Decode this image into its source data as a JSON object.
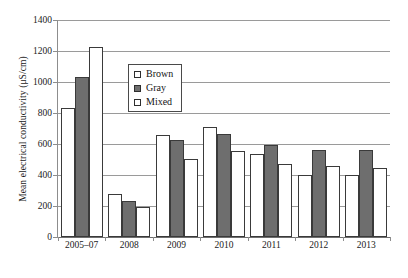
{
  "chart_data": {
    "type": "bar",
    "title": "",
    "xlabel": "",
    "ylabel": "Mean electrical conductivity (μS/cm)",
    "categories": [
      "2005–07",
      "2008",
      "2009",
      "2010",
      "2011",
      "2012",
      "2013"
    ],
    "series": [
      {
        "name": "Brown",
        "values": [
          830,
          275,
          655,
          710,
          535,
          400,
          400
        ]
      },
      {
        "name": "Gray",
        "values": [
          1030,
          230,
          625,
          665,
          595,
          560,
          560
        ]
      },
      {
        "name": "Mixed",
        "values": [
          1225,
          195,
          505,
          555,
          470,
          455,
          445
        ]
      }
    ],
    "ylim": [
      0,
      1400
    ],
    "yticks": [
      0,
      200,
      400,
      600,
      800,
      1000,
      1200,
      1400
    ],
    "ytick_labels": [
      "0",
      "200",
      "400",
      "600",
      "800",
      "1000",
      "1200",
      "1400"
    ],
    "grid": "horizontal",
    "legend_position": "upper-center-left",
    "legend": [
      {
        "label": "Brown",
        "swatch": "open-square"
      },
      {
        "label": "Gray",
        "swatch": "filled-square"
      },
      {
        "label": "Mixed",
        "swatch": "dotted-square"
      }
    ]
  }
}
